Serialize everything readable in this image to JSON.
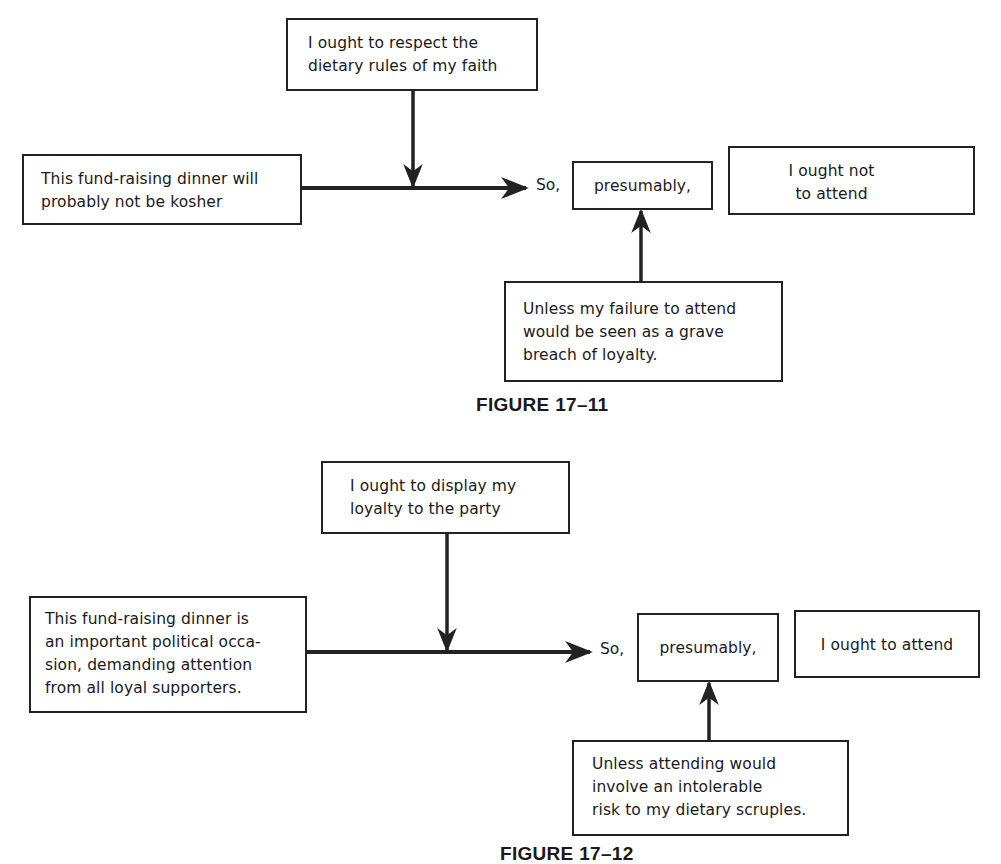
{
  "figures": [
    {
      "caption": "FIGURE 17–11",
      "warrant": "I ought to respect the\ndietary rules of my faith",
      "data": "This fund-raising dinner will\nprobably not be kosher",
      "connector": "So,",
      "qualifier": "presumably,",
      "conclusion": "I ought not\nto attend",
      "rebuttal": "Unless my failure to attend\nwould be seen as a grave\nbreach of loyalty."
    },
    {
      "caption": "FIGURE 17–12",
      "warrant": "I ought to display my\nloyalty to the party",
      "data": "This fund-raising dinner is\nan important political occa-\nsion, demanding attention\nfrom all loyal supporters.",
      "connector": "So,",
      "qualifier": "presumably,",
      "conclusion": "I ought to attend",
      "rebuttal": "Unless attending would\ninvolve an intolerable\nrisk to my dietary scruples."
    }
  ],
  "colors": {
    "ink": "#222222",
    "background": "#ffffff"
  }
}
